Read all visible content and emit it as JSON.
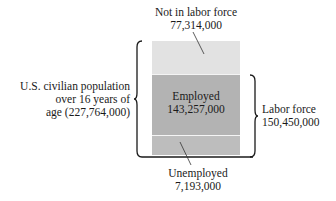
{
  "diagram": {
    "type": "stacked-breakdown",
    "total": {
      "label_line1": "U.S. civilian population",
      "label_line2": "over 16 years of",
      "label_line3": "age (227,764,000)",
      "value": 227764000
    },
    "segments": [
      {
        "id": "not-in-labor-force",
        "label": "Not in labor force",
        "value_text": "77,314,000",
        "value": 77314000,
        "color": "#e2e2e2"
      },
      {
        "id": "employed",
        "label": "Employed",
        "value_text": "143,257,000",
        "value": 143257000,
        "color": "#b3b3b3"
      },
      {
        "id": "unemployed",
        "label": "Unemployed",
        "value_text": "7,193,000",
        "value": 7193000,
        "color": "#bdbdbd"
      }
    ],
    "labor_force": {
      "label": "Labor force",
      "value_text": "150,450,000",
      "value": 150450000
    }
  }
}
